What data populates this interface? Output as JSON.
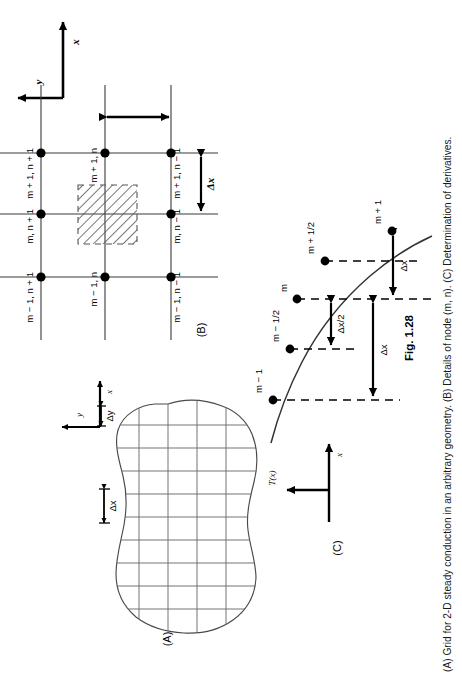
{
  "figure": {
    "number": "Fig. 1.28",
    "caption": "(A) Grid for 2-D steady conduction in an arbitrary geometry. (B) Details of node (m, n). (C) Determination of derivatives.",
    "panels": [
      {
        "id": "A",
        "label": "(A)",
        "title": "Grid for 2-D steady conduction in an arbitrary geometry"
      },
      {
        "id": "B",
        "label": "(B)",
        "title": "Details of node (m, n)"
      },
      {
        "id": "C",
        "label": "(C)",
        "title": "Determination of derivatives"
      }
    ]
  },
  "panel_a": {
    "label": "(A)",
    "axis_x": "x",
    "axis_y": "y",
    "dim_dx": "Δx",
    "dim_dy": "Δy"
  },
  "panel_b": {
    "label": "(B)",
    "axis_x": "x",
    "axis_y": "y",
    "dim_dx": "Δx",
    "node_labels": [
      "m + 1, n + 1",
      "m + 1, n",
      "m + 1, n − 1",
      "m, n + 1",
      "m, n − 1",
      "m − 1, n + 1",
      "m − 1, n",
      "m − 1, n − 1"
    ]
  },
  "panel_c": {
    "label": "(C)",
    "axis_x": "x",
    "axis_t": "T(x)",
    "curve_points": [
      {
        "name": "m − 1",
        "x": 0.0,
        "T": 0.0
      },
      {
        "name": "m − 1/2",
        "x": 0.25,
        "T": 0.43
      },
      {
        "name": "m",
        "x": 0.5,
        "T": 0.7
      },
      {
        "name": "m + 1/2",
        "x": 0.75,
        "T": 0.88
      },
      {
        "name": "m + 1",
        "x": 1.0,
        "T": 1.0
      }
    ],
    "dim_dx_half": "Δx/2",
    "dim_dx_lower": "Δx",
    "dim_dx_upper": "Δx"
  },
  "colors": {
    "ink": "#000000",
    "grid_line": "#3a3a3a",
    "hatch": "#555555",
    "outline": "#4a4a4a",
    "caption": "#1a1a1a"
  }
}
